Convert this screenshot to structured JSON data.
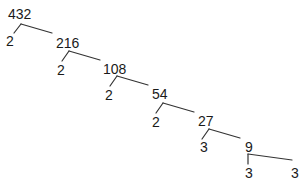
{
  "diagram": {
    "type": "factor-tree",
    "root": "432",
    "line_color": "#333333",
    "text_color": "#1a1a1a",
    "nodes": [
      {
        "id": "n432",
        "label": "432",
        "x": 8,
        "y": 7
      },
      {
        "id": "n2a",
        "label": "2",
        "x": 6,
        "y": 34
      },
      {
        "id": "n216",
        "label": "216",
        "x": 56,
        "y": 36
      },
      {
        "id": "n2b",
        "label": "2",
        "x": 57,
        "y": 63
      },
      {
        "id": "n108",
        "label": "108",
        "x": 103,
        "y": 62
      },
      {
        "id": "n2c",
        "label": "2",
        "x": 105,
        "y": 88
      },
      {
        "id": "n54",
        "label": "54",
        "x": 152,
        "y": 87
      },
      {
        "id": "n2d",
        "label": "2",
        "x": 152,
        "y": 115
      },
      {
        "id": "n27",
        "label": "27",
        "x": 198,
        "y": 114
      },
      {
        "id": "n3a",
        "label": "3",
        "x": 200,
        "y": 140
      },
      {
        "id": "n9",
        "label": "9",
        "x": 245,
        "y": 140
      },
      {
        "id": "n3b",
        "label": "3",
        "x": 245,
        "y": 166
      },
      {
        "id": "n3c",
        "label": "3",
        "x": 291,
        "y": 166
      }
    ],
    "edges": [
      {
        "from": "n432",
        "branch_point": [
          21,
          24
        ],
        "left_end": [
          14,
          33
        ],
        "right_end": [
          52,
          33
        ]
      },
      {
        "from": "n216",
        "branch_point": [
          69,
          51
        ],
        "left_end": [
          62,
          61
        ],
        "right_end": [
          100,
          60
        ]
      },
      {
        "from": "n108",
        "branch_point": [
          117,
          76
        ],
        "left_end": [
          110,
          86
        ],
        "right_end": [
          148,
          85
        ]
      },
      {
        "from": "n54",
        "branch_point": [
          163,
          103
        ],
        "left_end": [
          156,
          113
        ],
        "right_end": [
          194,
          112
        ]
      },
      {
        "from": "n27",
        "branch_point": [
          209,
          129
        ],
        "left_end": [
          202,
          139
        ],
        "right_end": [
          240,
          138
        ]
      },
      {
        "from": "n9",
        "branch_point": [
          248,
          154
        ],
        "left_end": [
          248,
          164
        ],
        "right_end": [
          292,
          160
        ]
      }
    ]
  }
}
